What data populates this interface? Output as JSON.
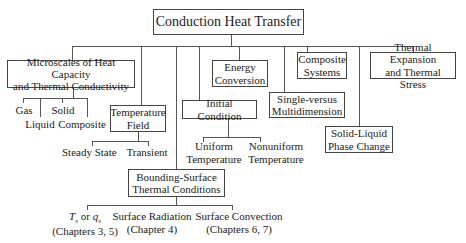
{
  "diagram": {
    "root": "Conduction Heat Transfer",
    "nodes": {
      "microscales": "Microscales of Heat Capacity and Thermal Conductivity",
      "microscales_l1": "Microscales of Heat Capacity",
      "microscales_l2": "and Thermal Conductivity",
      "gas": "Gas",
      "liquid": "Liquid",
      "solid": "Solid",
      "composite": "Composite",
      "temperature_field_l1": "Temperature",
      "temperature_field_l2": "Field",
      "steady_state": "Steady State",
      "transient": "Transient",
      "energy_conversion_l1": "Energy",
      "energy_conversion_l2": "Conversion",
      "initial_condition": "Initial Condition",
      "uniform_l1": "Uniform",
      "uniform_l2": "Temperature",
      "nonuniform_l1": "Nonuniform",
      "nonuniform_l2": "Temperature",
      "composite_systems_l1": "Composite",
      "composite_systems_l2": "Systems",
      "single_multi_l1": "Single-versus",
      "single_multi_l2": "Multidimension",
      "thermal_expansion_l1": "Thermal Expansion",
      "thermal_expansion_l2": "and Thermal Stress",
      "solid_liquid_l1": "Solid-Liquid",
      "solid_liquid_l2": "Phase Change",
      "bounding_l1": "Bounding-Surface",
      "bounding_l2": "Thermal Conditions",
      "ts_qs_T": "T",
      "ts_qs_sub1": "s",
      "ts_qs_or": " or ",
      "ts_qs_q": "q",
      "ts_qs_sub2": "s",
      "ts_qs_chapters": "(Chapters 3, 5)",
      "surface_radiation": "Surface Radiation",
      "surface_radiation_chapters": "(Chapter 4)",
      "surface_convection": "Surface Convection",
      "surface_convection_chapters": "(Chapters 6, 7)"
    }
  }
}
